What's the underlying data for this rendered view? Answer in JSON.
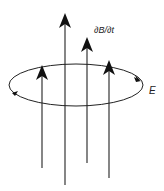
{
  "diagram": {
    "labels": {
      "field_change": "∂B/∂t",
      "electric_field": "E"
    },
    "colors": {
      "stroke": "#222222",
      "background": "#ffffff"
    },
    "field_lines": [
      {
        "x": 42,
        "y_top": 65,
        "y_bottom": 168
      },
      {
        "x": 65,
        "y_top": 13,
        "y_bottom": 185
      },
      {
        "x": 87,
        "y_top": 37,
        "y_bottom": 163
      },
      {
        "x": 109,
        "y_top": 60,
        "y_bottom": 178
      }
    ],
    "loop": {
      "cx": 76,
      "cy": 85,
      "rx": 67,
      "ry": 21,
      "direction": "counterclockwise-front"
    }
  }
}
